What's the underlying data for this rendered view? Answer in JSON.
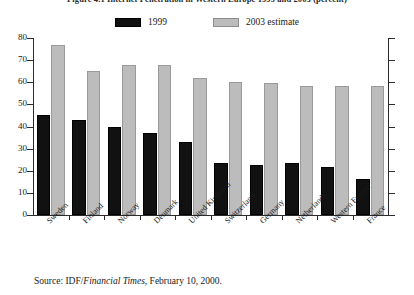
{
  "figure": {
    "title": "Figure 4.1 Internet Penetration in Western Europe 1999 and 2003 (percent)",
    "source_prefix": "Source:  IDF/",
    "source_italic": "Financial Times",
    "source_suffix": ", February 10, 2000."
  },
  "legend": {
    "position": "top-center",
    "entries": [
      {
        "label": "1999",
        "color": "#111111"
      },
      {
        "label": "2003 estimate",
        "color": "#bcbcbc"
      }
    ]
  },
  "chart_data": {
    "type": "bar",
    "title": "Figure 4.1 Internet Penetration in Western Europe 1999 and 2003 (percent)",
    "xlabel": "",
    "ylabel": "",
    "ylim": [
      0,
      80
    ],
    "yticks": [
      0,
      10,
      20,
      30,
      40,
      50,
      60,
      70,
      80
    ],
    "ytick_labels": [
      "0",
      "10",
      "20",
      "30",
      "40",
      "50",
      "60",
      "70",
      "80"
    ],
    "grid": false,
    "legend_position": "top-center",
    "categories": [
      "Sweden",
      "Finland",
      "Norway",
      "Denmark",
      "United Kingdom",
      "Switzerland",
      "Germany",
      "Netherlands",
      "Western Europe",
      "France"
    ],
    "series": [
      {
        "name": "1999",
        "color": "#111111",
        "values": [
          45,
          43,
          40,
          37,
          33,
          23.5,
          22.5,
          23.5,
          21.5,
          16.5
        ]
      },
      {
        "name": "2003 estimate",
        "color": "#bcbcbc",
        "values": [
          77,
          65,
          68,
          68,
          62,
          60,
          59.5,
          58.5,
          58.5,
          58.5
        ]
      }
    ]
  }
}
